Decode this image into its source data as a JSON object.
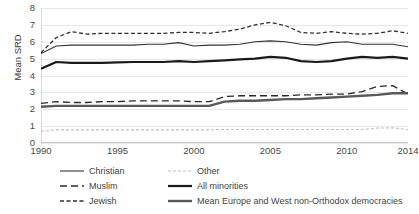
{
  "chart_data": {
    "type": "line",
    "title": "",
    "xlabel": "",
    "ylabel": "Mean SRD",
    "xlim": [
      1990,
      2014
    ],
    "ylim": [
      0,
      8
    ],
    "ytick_labels": [
      "0",
      "1",
      "2",
      "3",
      "4",
      "5",
      "6",
      "7",
      "8"
    ],
    "ytick_values": [
      0,
      1,
      2,
      3,
      4,
      5,
      6,
      7,
      8
    ],
    "xtick_labels": [
      "1990",
      "1995",
      "2000",
      "2005",
      "2010",
      "2014"
    ],
    "xtick_values": [
      1990,
      1995,
      2000,
      2005,
      2010,
      2014
    ],
    "grid": "horizontal",
    "legend_position": "bottom",
    "x": [
      1990,
      1991,
      1992,
      1993,
      1994,
      1995,
      1996,
      1997,
      1998,
      1999,
      2000,
      2001,
      2002,
      2003,
      2004,
      2005,
      2006,
      2007,
      2008,
      2009,
      2010,
      2011,
      2012,
      2013,
      2014
    ],
    "series": [
      {
        "name": "Jewish",
        "style": "short-dash",
        "color": "#2f2f2f",
        "width": 1.3,
        "values": [
          5.35,
          6.25,
          6.6,
          6.45,
          6.5,
          6.5,
          6.5,
          6.5,
          6.5,
          6.55,
          6.55,
          6.5,
          6.6,
          6.75,
          7.0,
          7.15,
          6.95,
          6.55,
          6.5,
          6.6,
          6.5,
          6.45,
          6.5,
          6.65,
          6.5
        ]
      },
      {
        "name": "Christian",
        "style": "solid",
        "color": "#333333",
        "width": 1.1,
        "values": [
          5.3,
          5.75,
          5.8,
          5.8,
          5.8,
          5.8,
          5.8,
          5.85,
          5.85,
          5.95,
          5.75,
          5.8,
          5.8,
          5.85,
          6.0,
          6.05,
          6.0,
          5.85,
          5.8,
          5.95,
          6.0,
          5.85,
          5.85,
          5.85,
          5.7
        ]
      },
      {
        "name": "All minorities",
        "style": "solid",
        "color": "#1a1a1a",
        "width": 2.2,
        "values": [
          4.4,
          4.8,
          4.75,
          4.75,
          4.75,
          4.78,
          4.8,
          4.8,
          4.8,
          4.85,
          4.8,
          4.85,
          4.9,
          4.95,
          5.0,
          5.1,
          5.05,
          4.85,
          4.8,
          4.85,
          5.0,
          5.1,
          5.05,
          5.1,
          5.0
        ]
      },
      {
        "name": "Muslim",
        "style": "long-dash",
        "color": "#2a2a2a",
        "width": 1.3,
        "values": [
          2.35,
          2.45,
          2.4,
          2.4,
          2.45,
          2.45,
          2.5,
          2.5,
          2.5,
          2.5,
          2.45,
          2.45,
          2.75,
          2.8,
          2.8,
          2.8,
          2.8,
          2.85,
          2.85,
          2.9,
          2.9,
          3.05,
          3.35,
          3.4,
          2.9
        ]
      },
      {
        "name": "Mean Europe and West non-Orthodox democracies",
        "style": "solid",
        "color": "#595959",
        "width": 2.4,
        "values": [
          2.15,
          2.2,
          2.2,
          2.2,
          2.2,
          2.2,
          2.2,
          2.2,
          2.2,
          2.2,
          2.2,
          2.2,
          2.45,
          2.5,
          2.5,
          2.55,
          2.6,
          2.6,
          2.65,
          2.7,
          2.75,
          2.8,
          2.85,
          2.95,
          2.95
        ]
      },
      {
        "name": "Other",
        "style": "dotted",
        "color": "#bfbfbf",
        "width": 1.1,
        "values": [
          0.7,
          0.78,
          0.78,
          0.78,
          0.78,
          0.78,
          0.78,
          0.78,
          0.78,
          0.78,
          0.78,
          0.78,
          0.8,
          0.8,
          0.8,
          0.8,
          0.8,
          0.8,
          0.8,
          0.8,
          0.8,
          0.8,
          0.88,
          0.9,
          0.8
        ]
      }
    ]
  },
  "legend": {
    "items": [
      {
        "label": "Christian",
        "series": "Christian"
      },
      {
        "label": "Other",
        "series": "Other"
      },
      {
        "label": "Muslim",
        "series": "Muslim"
      },
      {
        "label": "All minorities",
        "series": "All minorities"
      },
      {
        "label": "Jewish",
        "series": "Jewish"
      },
      {
        "label": "Mean Europe and West non-Orthodox democracies",
        "series": "Mean Europe and West non-Orthodox democracies"
      }
    ]
  },
  "colors": {
    "grid": "#e8e8e8",
    "axis": "#c9c9c9",
    "text": "#404040"
  }
}
